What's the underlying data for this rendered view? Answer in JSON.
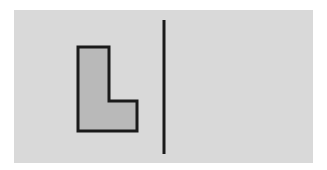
{
  "figure": {
    "background_color": "#ffffff",
    "panel": {
      "x": 14,
      "y": 10,
      "width": 299,
      "height": 153,
      "fill": "#d9d9d9"
    },
    "shape": {
      "name": "L-shape",
      "points": "78,47 109,47 109,101 137,101 137,131 78,131",
      "fill": "#b9b9b9",
      "stroke": "#1a1a1a",
      "stroke_width": 3
    },
    "mirror_line": {
      "x1": 164,
      "y1": 20,
      "x2": 164,
      "y2": 154,
      "stroke": "#1a1a1a",
      "stroke_width": 3
    }
  }
}
